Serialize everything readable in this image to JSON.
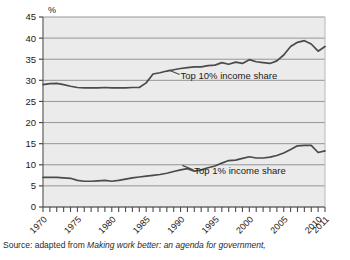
{
  "chart_data": {
    "type": "line",
    "title": "",
    "xlabel": "",
    "ylabel": "%",
    "ylim": [
      0,
      45
    ],
    "xlim": [
      1970,
      2011
    ],
    "ytick_step": 5,
    "grid": true,
    "legend_position": "inline-annotations",
    "yticks": [
      "0",
      "5",
      "10",
      "15",
      "20",
      "25",
      "30",
      "35",
      "40",
      "45"
    ],
    "xticks": [
      "1970",
      "1975",
      "1980",
      "1985",
      "1990",
      "1995",
      "2000",
      "2005",
      "2010",
      "2011"
    ],
    "x": [
      1970,
      1971,
      1972,
      1973,
      1974,
      1975,
      1976,
      1977,
      1978,
      1979,
      1980,
      1981,
      1982,
      1983,
      1984,
      1985,
      1986,
      1987,
      1988,
      1989,
      1990,
      1991,
      1992,
      1993,
      1994,
      1995,
      1996,
      1997,
      1998,
      1999,
      2000,
      2001,
      2002,
      2003,
      2004,
      2005,
      2006,
      2007,
      2008,
      2009,
      2010,
      2011
    ],
    "series": [
      {
        "name": "Top 10% income share",
        "color": "#4a4a4a",
        "values": [
          29.0,
          29.2,
          29.3,
          29.0,
          28.6,
          28.3,
          28.2,
          28.2,
          28.2,
          28.3,
          28.2,
          28.2,
          28.2,
          28.3,
          28.3,
          29.4,
          31.5,
          31.8,
          32.2,
          32.5,
          32.8,
          33.0,
          33.2,
          33.2,
          33.5,
          33.6,
          34.2,
          33.8,
          34.3,
          34.0,
          34.9,
          34.4,
          34.2,
          34.0,
          34.6,
          36.0,
          38.0,
          39.0,
          39.4,
          38.6,
          36.9,
          38.0
        ],
        "annotation": {
          "text": "Top 10% income share",
          "x": 1990,
          "y": 30.8
        }
      },
      {
        "name": "Top 1% income share",
        "color": "#4a4a4a",
        "values": [
          7.0,
          7.0,
          7.0,
          6.9,
          6.8,
          6.3,
          6.1,
          6.1,
          6.2,
          6.3,
          6.1,
          6.3,
          6.6,
          6.9,
          7.1,
          7.3,
          7.5,
          7.7,
          8.0,
          8.4,
          8.8,
          9.1,
          8.5,
          8.8,
          9.3,
          9.7,
          10.4,
          11.0,
          11.1,
          11.5,
          11.9,
          11.6,
          11.6,
          11.8,
          12.2,
          12.8,
          13.6,
          14.5,
          14.6,
          14.6,
          12.9,
          13.3
        ],
        "annotation": {
          "text": "Top 1% income share",
          "x": 1992,
          "y": 8.2
        }
      }
    ]
  },
  "source": {
    "prefix": "Source: adapted from ",
    "title": "Making work better: an agenda for government,"
  }
}
